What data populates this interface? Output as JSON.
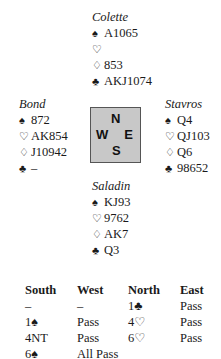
{
  "hands": {
    "north": {
      "name": "Colette",
      "spades": "A1065",
      "hearts": "",
      "diamonds": "853",
      "clubs": "AKJ1074"
    },
    "west": {
      "name": "Bond",
      "spades": "872",
      "hearts": "AK854",
      "diamonds": "J10942",
      "clubs": "–"
    },
    "east": {
      "name": "Stavros",
      "spades": "Q4",
      "hearts": "QJ103",
      "diamonds": "Q6",
      "clubs": "98652"
    },
    "south": {
      "name": "Saladin",
      "spades": "KJ93",
      "hearts": "9762",
      "diamonds": "AK7",
      "clubs": "Q3"
    }
  },
  "symbols": {
    "spades": "♠",
    "hearts": "♡",
    "diamonds": "♢",
    "clubs": "♣"
  },
  "compass": {
    "n": "N",
    "w": "W",
    "e": "E",
    "s": "S"
  },
  "auction": {
    "headers": [
      "South",
      "West",
      "North",
      "East"
    ],
    "rows": [
      [
        "–",
        "–",
        "1♣",
        "Pass"
      ],
      [
        "1♠",
        "Pass",
        "4♡",
        "Pass"
      ],
      [
        "4NT",
        "Pass",
        "6♡",
        "Pass"
      ],
      [
        "6♠",
        "All Pass",
        "",
        ""
      ]
    ]
  }
}
